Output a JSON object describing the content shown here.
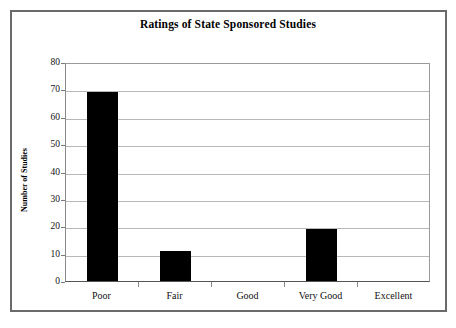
{
  "chart_data": {
    "type": "bar",
    "title": "Ratings of State Sponsored Studies",
    "xlabel": "",
    "ylabel": "Number of Studies",
    "categories": [
      "Poor",
      "Fair",
      "Good",
      "Very Good",
      "Excellent"
    ],
    "values": [
      69,
      11,
      0,
      19,
      0
    ],
    "ylim": [
      0,
      80
    ],
    "ytick_labels": [
      "80",
      "70",
      "60",
      "50",
      "40",
      "30",
      "20",
      "10",
      "0"
    ],
    "ytick_values": [
      80,
      70,
      60,
      50,
      40,
      30,
      20,
      10,
      0
    ],
    "ytick_interval": 10,
    "grid": "horizontal",
    "legend": "none",
    "bar_color": "#000000",
    "plot_background": "#ffffff",
    "frame_color": "#6a6a6a",
    "gridline_color": "#b8b8b8"
  }
}
